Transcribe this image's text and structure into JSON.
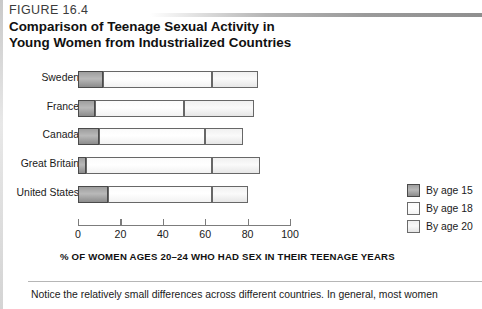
{
  "figure": {
    "label": "FIGURE 16.4",
    "title_line1": "Comparison of Teenage Sexual Activity in",
    "title_line2": "Young Women from Industrialized Countries"
  },
  "caption": "Notice the relatively small differences across different countries. In general, most women",
  "colors": {
    "by_age_15": "#a8a8a8",
    "by_age_18": "#ffffff",
    "by_age_20": "#efefef",
    "outline": "#4a4a4a",
    "axis": "#7c7c7c"
  },
  "legend": {
    "items": [
      {
        "label": "By age 15",
        "swatch": "sw15"
      },
      {
        "label": "By age 18",
        "swatch": "sw18"
      },
      {
        "label": "By age 20",
        "swatch": "sw20"
      }
    ]
  },
  "chart_data": {
    "type": "bar",
    "orientation": "horizontal",
    "stacked": true,
    "title": "Comparison of Teenage Sexual Activity in Young Women from Industrialized Countries",
    "xlabel": "% OF WOMEN AGES 20–24 WHO HAD SEX IN THEIR TEENAGE YEARS",
    "ylabel": "",
    "xlim": [
      0,
      100
    ],
    "xticks": [
      0,
      20,
      40,
      60,
      80,
      100
    ],
    "xtick_labels": [
      "0",
      "20",
      "40",
      "60",
      "80",
      "100"
    ],
    "grid": false,
    "legend_position": "right",
    "categories": [
      "Sweden",
      "France",
      "Canada",
      "Great Britain",
      "United States"
    ],
    "series": [
      {
        "name": "By age 15",
        "values": [
          12,
          8,
          10,
          4,
          14
        ]
      },
      {
        "name": "By age 18",
        "values": [
          63,
          50,
          60,
          63,
          63
        ]
      },
      {
        "name": "By age 20",
        "values": [
          85,
          83,
          78,
          86,
          80
        ]
      }
    ],
    "note": "Series values are cumulative percentages: each bar segment ends at the stated percentage."
  }
}
